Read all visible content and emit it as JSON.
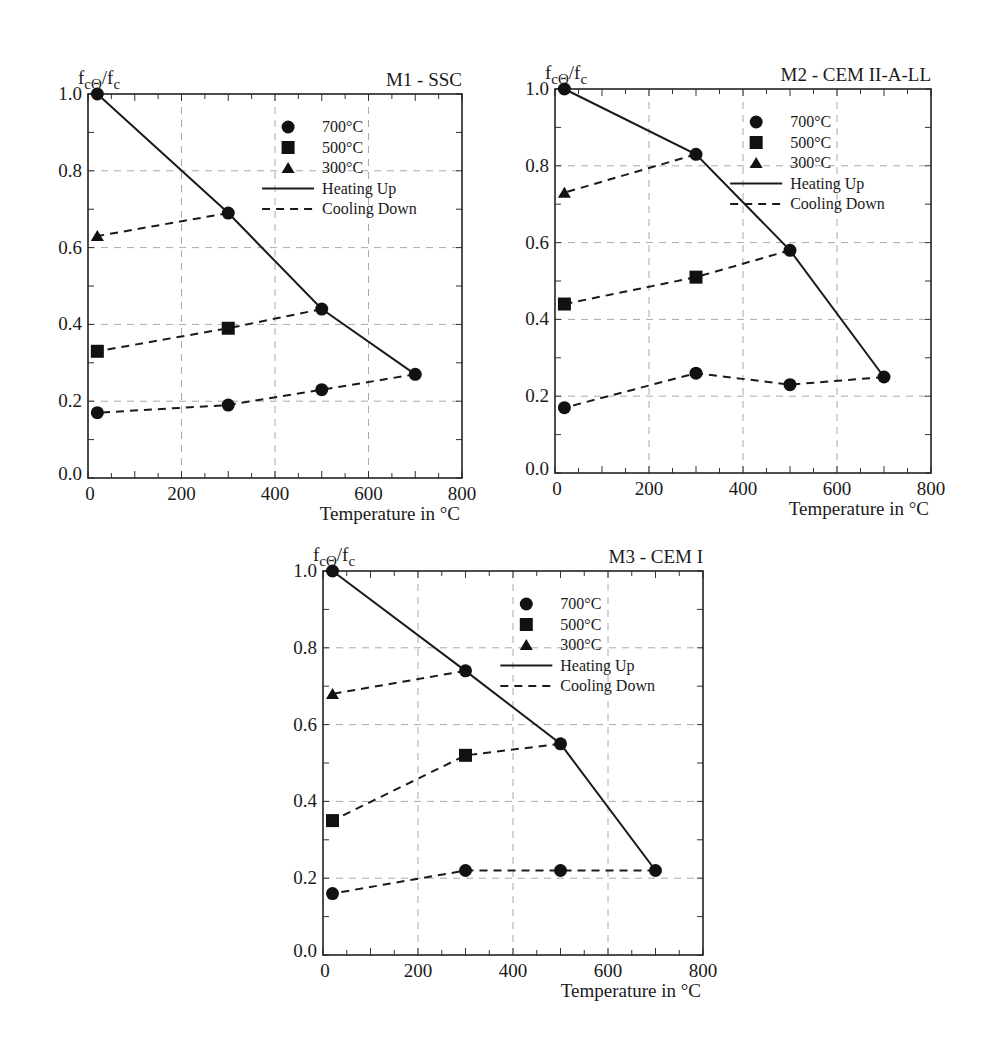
{
  "figure": {
    "y_label_main": "f",
    "y_label_sub1": "cΘ",
    "y_label_slash": "/f",
    "y_label_sub2": "c",
    "x_label": "Temperature in °C",
    "legend": {
      "marker_700": "700°C",
      "marker_500": "500°C",
      "marker_300": "300°C",
      "heating": "Heating Up",
      "cooling": "Cooling Down"
    }
  },
  "chart_data": [
    {
      "type": "line",
      "title": "M1 - SSC",
      "xlabel": "Temperature in °C",
      "ylabel": "fcΘ/fc",
      "xlim": [
        0,
        800
      ],
      "ylim": [
        0,
        1.0
      ],
      "x_ticks": [
        0,
        200,
        400,
        600,
        800
      ],
      "y_ticks": [
        0.0,
        0.2,
        0.4,
        0.6,
        0.8,
        1.0
      ],
      "grid": true,
      "legend_position": "upper right",
      "frame": {
        "left": 88,
        "top": 94,
        "right": 462,
        "bottom": 478
      },
      "series": [
        {
          "name": "Heating Up",
          "style": "solid",
          "marker": "circle",
          "x": [
            20,
            300,
            500,
            700
          ],
          "y": [
            1.0,
            0.69,
            0.44,
            0.27
          ]
        },
        {
          "name": "Cooling Down 300°C",
          "style": "dashed",
          "marker": "triangle",
          "x": [
            300,
            20
          ],
          "y": [
            0.69,
            0.63
          ]
        },
        {
          "name": "Cooling Down 500°C",
          "style": "dashed",
          "marker": "square",
          "x": [
            500,
            300,
            20
          ],
          "y": [
            0.44,
            0.39,
            0.33
          ]
        },
        {
          "name": "Cooling Down 700°C",
          "style": "dashed",
          "marker": "circle",
          "x": [
            700,
            500,
            300,
            20
          ],
          "y": [
            0.27,
            0.23,
            0.19,
            0.17
          ]
        }
      ]
    },
    {
      "type": "line",
      "title": "M2 - CEM II-A-LL",
      "xlabel": "Temperature in °C",
      "ylabel": "fcΘ/fc",
      "xlim": [
        0,
        800
      ],
      "ylim": [
        0,
        1.0
      ],
      "x_ticks": [
        0,
        200,
        400,
        600,
        800
      ],
      "y_ticks": [
        0.0,
        0.2,
        0.4,
        0.6,
        0.8,
        1.0
      ],
      "grid": true,
      "legend_position": "upper right",
      "frame": {
        "left": 555,
        "top": 89,
        "right": 931,
        "bottom": 473
      },
      "series": [
        {
          "name": "Heating Up",
          "style": "solid",
          "marker": "circle",
          "x": [
            20,
            300,
            500,
            700
          ],
          "y": [
            1.0,
            0.83,
            0.58,
            0.25
          ]
        },
        {
          "name": "Cooling Down 300°C",
          "style": "dashed",
          "marker": "triangle",
          "x": [
            300,
            20
          ],
          "y": [
            0.83,
            0.73
          ]
        },
        {
          "name": "Cooling Down 500°C",
          "style": "dashed",
          "marker": "square",
          "x": [
            500,
            300,
            20
          ],
          "y": [
            0.58,
            0.51,
            0.44
          ]
        },
        {
          "name": "Cooling Down 700°C",
          "style": "dashed",
          "marker": "circle",
          "x": [
            700,
            500,
            300,
            20
          ],
          "y": [
            0.25,
            0.23,
            0.26,
            0.17
          ]
        }
      ]
    },
    {
      "type": "line",
      "title": "M3 - CEM I",
      "xlabel": "Temperature in °C",
      "ylabel": "fcΘ/fc",
      "xlim": [
        0,
        800
      ],
      "ylim": [
        0,
        1.0
      ],
      "x_ticks": [
        0,
        200,
        400,
        600,
        800
      ],
      "y_ticks": [
        0.0,
        0.2,
        0.4,
        0.6,
        0.8,
        1.0
      ],
      "grid": true,
      "legend_position": "upper right",
      "frame": {
        "left": 323,
        "top": 571,
        "right": 703,
        "bottom": 955
      },
      "series": [
        {
          "name": "Heating Up",
          "style": "solid",
          "marker": "circle",
          "x": [
            20,
            300,
            500,
            700
          ],
          "y": [
            1.0,
            0.74,
            0.55,
            0.22
          ]
        },
        {
          "name": "Cooling Down 300°C",
          "style": "dashed",
          "marker": "triangle",
          "x": [
            300,
            20
          ],
          "y": [
            0.74,
            0.68
          ]
        },
        {
          "name": "Cooling Down 500°C",
          "style": "dashed",
          "marker": "square",
          "x": [
            500,
            300,
            20
          ],
          "y": [
            0.55,
            0.52,
            0.35
          ]
        },
        {
          "name": "Cooling Down 700°C",
          "style": "dashed",
          "marker": "circle",
          "x": [
            700,
            500,
            300,
            20
          ],
          "y": [
            0.22,
            0.22,
            0.22,
            0.16
          ]
        }
      ]
    }
  ]
}
